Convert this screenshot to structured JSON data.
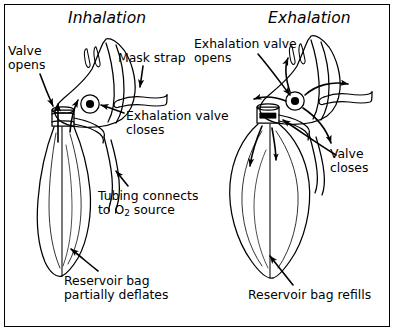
{
  "figure": {
    "border_color": "#000000",
    "background_color": "#ffffff",
    "ink_color": "#000000",
    "panels": [
      {
        "id": "inhalation",
        "title": "Inhalation",
        "bag_state": "partially deflated",
        "labels": [
          "Valve\nopens",
          "Mask strap",
          "Exhalation valve\ncloses",
          "Tubing connects\nto O2 source",
          "Reservoir bag\npartially deflates"
        ]
      },
      {
        "id": "exhalation",
        "title": "Exhalation",
        "bag_state": "refilled",
        "labels": [
          "Exhalation valve\nopens",
          "Valve\ncloses",
          "Reservoir bag refills"
        ]
      }
    ]
  },
  "left_panel": {
    "title": "Inhalation",
    "valve_opens": "Valve\nopens",
    "mask_strap": "Mask strap",
    "exhalation_valve_closes": "Exhalation valve\ncloses",
    "tubing_line1": "Tubing connects",
    "tubing_line2_prefix": "to O",
    "tubing_line2_sub": "2",
    "tubing_line2_suffix": " source",
    "reservoir_bag": "Reservoir bag\npartially deflates"
  },
  "right_panel": {
    "title": "Exhalation",
    "exhalation_valve_opens": "Exhalation valve\nopens",
    "valve_closes": "Valve\ncloses",
    "reservoir_bag": "Reservoir bag refills"
  }
}
